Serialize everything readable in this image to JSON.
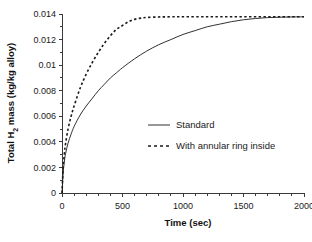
{
  "chart_data": {
    "type": "line",
    "title": "",
    "xlabel": "Time (sec)",
    "ylabel": "Total H2 mass (kg/kg alloy)",
    "ylabel_parts": {
      "pre": "Total H",
      "sub": "2",
      "post": " mass (kg/kg alloy)"
    },
    "xlim": [
      0,
      2000
    ],
    "ylim": [
      0,
      0.014
    ],
    "grid": false,
    "legend_position": "center-right-inside",
    "x_ticks": [
      0,
      500,
      1000,
      1500,
      2000
    ],
    "x_tick_labels": [
      "0",
      "500",
      "1000",
      "1500",
      "2000"
    ],
    "x_minor_tick_step": 100,
    "y_ticks": [
      0,
      0.002,
      0.004,
      0.006,
      0.008,
      0.01,
      0.012,
      0.014
    ],
    "y_tick_labels": [
      "0",
      "0.002",
      "0.004",
      "0.006",
      "0.008",
      "0.01",
      "0.012",
      "0.014"
    ],
    "series": [
      {
        "name": "Standard",
        "style": "solid",
        "color": "#1a1a1a",
        "x": [
          0,
          10,
          20,
          30,
          50,
          75,
          100,
          150,
          200,
          250,
          300,
          350,
          400,
          450,
          500,
          600,
          700,
          800,
          900,
          1000,
          1100,
          1200,
          1300,
          1400,
          1500,
          1600,
          1700,
          1800,
          1900,
          2000
        ],
        "y": [
          0.0,
          0.0016,
          0.0025,
          0.0031,
          0.0039,
          0.0046,
          0.0052,
          0.0061,
          0.0068,
          0.0074,
          0.008,
          0.0085,
          0.009,
          0.0094,
          0.0098,
          0.0105,
          0.0111,
          0.0116,
          0.012,
          0.0124,
          0.0127,
          0.013,
          0.0132,
          0.0134,
          0.01355,
          0.01365,
          0.01372,
          0.01375,
          0.01377,
          0.01378
        ]
      },
      {
        "name": "With annular ring inside",
        "style": "dashed",
        "color": "#1a1a1a",
        "x": [
          0,
          10,
          20,
          30,
          50,
          75,
          100,
          150,
          200,
          250,
          300,
          350,
          400,
          450,
          500,
          550,
          600,
          650,
          700,
          800,
          900,
          1000,
          1200,
          1400,
          1600,
          1800,
          2000
        ],
        "y": [
          0.0,
          0.002,
          0.0031,
          0.0039,
          0.005,
          0.006,
          0.0068,
          0.0082,
          0.0093,
          0.0102,
          0.011,
          0.0117,
          0.0123,
          0.0128,
          0.0131,
          0.0134,
          0.01358,
          0.01368,
          0.01373,
          0.01377,
          0.01378,
          0.01379,
          0.01379,
          0.01379,
          0.01379,
          0.01379,
          0.01379
        ]
      }
    ],
    "legend_entries": [
      {
        "label": "Standard",
        "style": "solid"
      },
      {
        "label": "With annular ring inside",
        "style": "dashed"
      }
    ]
  }
}
